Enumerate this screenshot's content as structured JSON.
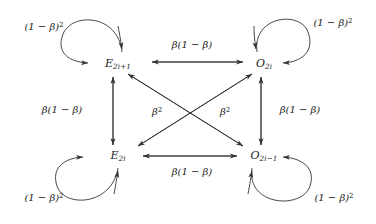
{
  "figure": {
    "type": "state-transition-diagram",
    "background_color": "#ffffff",
    "stroke_color": "#333333",
    "text_color": "#1a1a1a"
  },
  "nodes": [
    {
      "id": "E_odd",
      "base": "E",
      "subscript": "2i+1",
      "label": "E2i+1",
      "x": 118,
      "y": 64,
      "position": "top-left"
    },
    {
      "id": "O_even",
      "base": "O",
      "subscript": "2i",
      "label": "O2i",
      "x": 264,
      "y": 64,
      "position": "top-right"
    },
    {
      "id": "E_even",
      "base": "E",
      "subscript": "2i",
      "label": "E2i",
      "x": 118,
      "y": 156,
      "position": "bottom-left"
    },
    {
      "id": "O_odd",
      "base": "O",
      "subscript": "2i-1",
      "label": "O2i-1",
      "x": 264,
      "y": 156,
      "position": "bottom-right"
    }
  ],
  "edges": [
    {
      "id": "top-horizontal",
      "from": "E_odd",
      "to": "O_even",
      "direction": "bidirectional",
      "label_base": "β(1 − β)",
      "label_x": 192,
      "label_y": 45
    },
    {
      "id": "bottom-horizontal",
      "from": "E_even",
      "to": "O_odd",
      "direction": "bidirectional",
      "label_base": "β(1 − β)",
      "label_x": 192,
      "label_y": 172
    },
    {
      "id": "left-vertical",
      "from": "E_even",
      "to": "E_odd",
      "direction": "bidirectional",
      "label_base": "β(1 − β)",
      "label_x": 62,
      "label_y": 110
    },
    {
      "id": "right-vertical",
      "from": "O_odd",
      "to": "O_even",
      "direction": "bidirectional",
      "label_base": "β(1 − β)",
      "label_x": 300,
      "label_y": 110
    },
    {
      "id": "diagonal-left",
      "from": "E_odd",
      "to": "O_odd",
      "direction": "bidirectional",
      "label_base": "β",
      "label_sup": "2",
      "label_x": 157,
      "label_y": 112
    },
    {
      "id": "diagonal-right",
      "from": "O_even",
      "to": "E_even",
      "direction": "bidirectional",
      "label_base": "β",
      "label_sup": "2",
      "label_x": 225,
      "label_y": 112
    }
  ],
  "self_loops": [
    {
      "id": "loop-top-left",
      "node": "E_odd",
      "label_base": "(1 − β)",
      "label_sup": "2",
      "label_x": 44,
      "label_y": 27
    },
    {
      "id": "loop-top-right",
      "node": "O_even",
      "label_base": "(1 − β)",
      "label_sup": "2",
      "label_x": 333,
      "label_y": 23
    },
    {
      "id": "loop-bottom-left",
      "node": "E_even",
      "label_base": "(1 − β)",
      "label_sup": "2",
      "label_x": 44,
      "label_y": 198
    },
    {
      "id": "loop-bottom-right",
      "node": "O_odd",
      "label_base": "(1 − β)",
      "label_sup": "2",
      "label_x": 334,
      "label_y": 198
    }
  ],
  "node_text": {
    "e_odd_base": "E",
    "e_odd_sub": "2i+1",
    "o_even_base": "O",
    "o_even_sub": "2i",
    "e_even_base": "E",
    "e_even_sub": "2i",
    "o_odd_base": "O",
    "o_odd_sub": "2i−1"
  },
  "label_text": {
    "beta_one_minus_beta": "β(1 − β)",
    "beta_base": "β",
    "beta_squared_sup": "2",
    "one_minus_beta_base": "(1 − β)",
    "one_minus_beta_sup": "2"
  }
}
